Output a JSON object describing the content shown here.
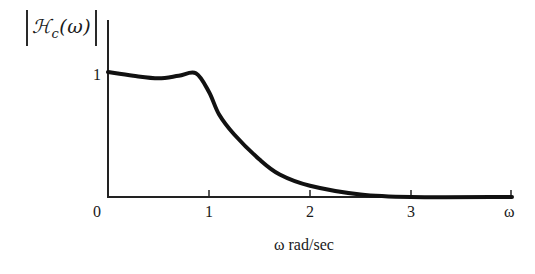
{
  "chart_data": {
    "type": "line",
    "title": "",
    "ylabel": "|ℋ_c(ω)|",
    "ylabel_parts": {
      "symbol": "ℋ",
      "subscript": "c",
      "argument": "(ω)"
    },
    "xlabel": "ω rad/sec",
    "x_axis_end_label": "ω",
    "x_ticks": [
      0,
      1,
      2,
      3
    ],
    "x_tick_labels": [
      "0",
      "1",
      "2",
      "3"
    ],
    "y_ticks": [
      1
    ],
    "y_tick_labels": [
      "1"
    ],
    "xlim": [
      0,
      4
    ],
    "ylim": [
      0,
      1.2
    ],
    "grid": false,
    "legend": null,
    "series": [
      {
        "name": "|Hc(ω)| (Chebyshev-like lowpass magnitude response)",
        "x": [
          0,
          0.25,
          0.5,
          0.7,
          0.87,
          1.0,
          1.1,
          1.25,
          1.5,
          1.7,
          2.0,
          2.5,
          3.0,
          4.0
        ],
        "y": [
          1.0,
          0.97,
          0.95,
          0.97,
          0.99,
          0.84,
          0.66,
          0.5,
          0.3,
          0.18,
          0.09,
          0.02,
          0.0,
          0.0
        ]
      }
    ]
  },
  "labels": {
    "y_symbol": "ℋ",
    "y_sub": "c",
    "y_arg": "(ω)",
    "tick_0": "0",
    "tick_1": "1",
    "tick_2": "2",
    "tick_3": "3",
    "tick_omega": "ω",
    "y_tick_1": "1",
    "xlabel": "ω rad/sec"
  },
  "colors": {
    "line": "#111111",
    "axis": "#222222"
  }
}
